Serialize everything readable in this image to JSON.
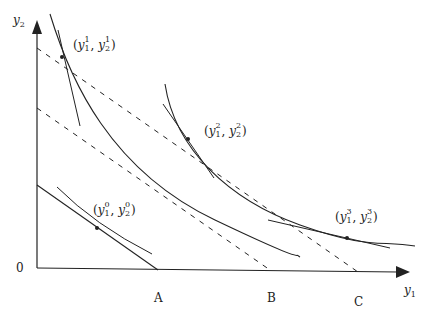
{
  "diagram": {
    "type": "indifference curves with budget lines (consumer choice)",
    "axes": {
      "x_label": "y",
      "x_label_sub": "1",
      "y_label": "y",
      "y_label_sub": "2",
      "origin_label": "0"
    },
    "intercept_labels": [
      "A",
      "B",
      "C"
    ],
    "points": [
      {
        "id": "p0",
        "base": "y",
        "sup": "0",
        "sub1": "1",
        "sub2": "2",
        "x": 97,
        "y": 228
      },
      {
        "id": "p1",
        "base": "y",
        "sup": "1",
        "sub1": "1",
        "sub2": "2",
        "x": 62,
        "y": 57
      },
      {
        "id": "p2",
        "base": "y",
        "sup": "2",
        "sub1": "1",
        "sub2": "2",
        "x": 188,
        "y": 139
      },
      {
        "id": "p3",
        "base": "y",
        "sup": "3",
        "sub1": "1",
        "sub2": "2",
        "x": 347,
        "y": 238
      }
    ],
    "colors": {
      "line": "#222222",
      "background": "#ffffff"
    }
  },
  "labels": {
    "origin": "0",
    "A": "A",
    "B": "B",
    "C": "C",
    "y": "y",
    "one": "1",
    "two": "2",
    "zero": "0",
    "three": "3",
    "paren_open": "(",
    "paren_close": ")",
    "comma": ","
  }
}
